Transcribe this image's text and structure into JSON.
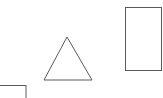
{
  "canvas": {
    "width": 163,
    "height": 98,
    "background": "#ffffff",
    "stroke_color": "#5a5a5a",
    "stroke_width": 1
  },
  "shapes": [
    {
      "type": "triangle",
      "name": "triangle",
      "points": [
        [
          67,
          37
        ],
        [
          44,
          80
        ],
        [
          92,
          80
        ]
      ]
    },
    {
      "type": "rectangle",
      "name": "tall-rectangle",
      "x": 125.5,
      "y": 7.5,
      "width": 36,
      "height": 63
    },
    {
      "type": "rectangle",
      "name": "partial-rectangle",
      "x": -1,
      "y": 85.5,
      "width": 27,
      "height": 20
    }
  ]
}
